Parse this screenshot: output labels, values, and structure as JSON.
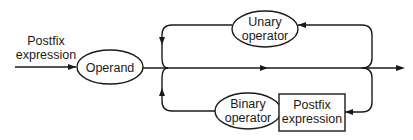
{
  "diagram": {
    "type": "syntax-diagram",
    "input_label": [
      "Postfix",
      "expression"
    ],
    "nodes": {
      "operand": {
        "label": [
          "Operand"
        ],
        "shape": "ellipse"
      },
      "unary": {
        "label": [
          "Unary",
          "operator"
        ],
        "shape": "ellipse"
      },
      "binary": {
        "label": [
          "Binary",
          "operator"
        ],
        "shape": "ellipse"
      },
      "postfix": {
        "label": [
          "Postfix",
          "expression"
        ],
        "shape": "rectangle"
      }
    },
    "edges": [
      {
        "from": "input",
        "to": "operand"
      },
      {
        "from": "operand",
        "to": "output"
      },
      {
        "from": "output-junction",
        "to": "unary",
        "note": "top loop back"
      },
      {
        "from": "unary",
        "to": "main-line"
      },
      {
        "from": "output-junction",
        "to": "postfix",
        "note": "bottom loop back"
      },
      {
        "from": "postfix",
        "to": "binary"
      },
      {
        "from": "binary",
        "to": "main-line"
      }
    ],
    "colors": {
      "stroke": "#1a1a1a",
      "background": "#ffffff"
    }
  }
}
